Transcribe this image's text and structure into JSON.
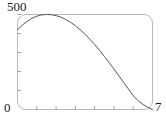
{
  "figure": {
    "background_color": "#ffffff",
    "frame_color": "#b9b9b9",
    "curve_color": "#555555"
  },
  "labels": {
    "y_max": "500",
    "origin": "0",
    "x_max": "7"
  },
  "chart_data": {
    "type": "line",
    "title": "",
    "subtitle": "",
    "xlabel": "",
    "ylabel": "",
    "xlim": [
      0,
      7
    ],
    "ylim": [
      0,
      500
    ],
    "xticks": [
      1,
      2,
      3,
      4,
      5,
      6
    ],
    "xticklabels": [
      "",
      "",
      "",
      "",
      "",
      ""
    ],
    "yticks": [
      100,
      200,
      300,
      400,
      500
    ],
    "yticklabels": [
      "",
      "",
      "",
      "",
      ""
    ],
    "corner_labels": {
      "y_top": "500",
      "origin": "0",
      "x_right": "7"
    },
    "grid": false,
    "legend": null,
    "annotations": [],
    "series": [
      {
        "name": "trajectory",
        "color": "#555555",
        "linewidth": 1,
        "x": [
          0.0,
          0.25,
          0.5,
          0.75,
          1.0,
          1.25,
          1.5,
          1.75,
          2.0,
          2.25,
          2.5,
          2.75,
          3.0,
          3.25,
          3.5,
          3.75,
          4.0,
          4.25,
          4.5,
          4.75,
          5.0,
          5.25,
          5.5,
          5.75,
          6.0,
          6.25,
          6.5,
          6.75,
          7.0
        ],
        "y": [
          420,
          444,
          464,
          480,
          491,
          498,
          500,
          499,
          494,
          486,
          474,
          459,
          441,
          420,
          396,
          370,
          342,
          312,
          280,
          247,
          213,
          178,
          143,
          108,
          73,
          47,
          27,
          12,
          0
        ]
      }
    ]
  }
}
